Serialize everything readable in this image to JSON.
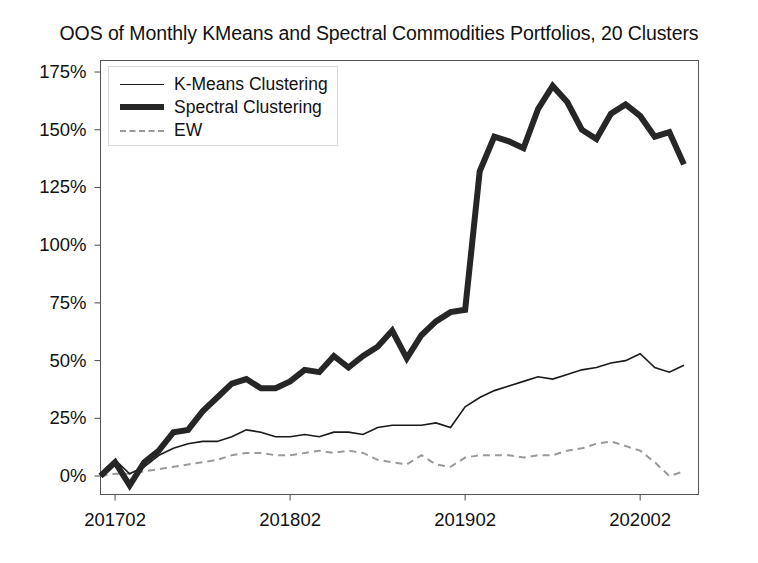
{
  "chart_data": {
    "type": "line",
    "title": "OOS of Monthly KMeans and Spectral Commodities Portfolios, 20 Clusters",
    "xlabel": "",
    "ylabel": "",
    "xlim": [
      201701,
      202006
    ],
    "ylim": [
      -8,
      180
    ],
    "grid": false,
    "legend_position": "upper left",
    "y_ticks": [
      0,
      25,
      50,
      75,
      100,
      125,
      150,
      175
    ],
    "y_tick_labels": [
      "0%",
      "25%",
      "50%",
      "75%",
      "100%",
      "125%",
      "150%",
      "175%"
    ],
    "x_ticks": [
      201702,
      201802,
      201902,
      202002
    ],
    "x_tick_labels": [
      "201702",
      "201802",
      "201902",
      "202002"
    ],
    "x": [
      201701,
      201702,
      201703,
      201704,
      201705,
      201706,
      201707,
      201708,
      201709,
      201710,
      201711,
      201712,
      201801,
      201802,
      201803,
      201804,
      201805,
      201806,
      201807,
      201808,
      201809,
      201810,
      201811,
      201812,
      201901,
      201902,
      201903,
      201904,
      201905,
      201906,
      201907,
      201908,
      201909,
      201910,
      201911,
      201912,
      202001,
      202002,
      202003,
      202004,
      202005
    ],
    "series": [
      {
        "name": "K-Means Clustering",
        "color": "#1a1a1a",
        "linestyle": "solid",
        "linewidth": 1.6,
        "values": [
          0,
          7,
          1,
          4,
          9,
          12,
          14,
          15,
          15,
          17,
          20,
          19,
          17,
          17,
          18,
          17,
          19,
          19,
          18,
          21,
          22,
          22,
          22,
          23,
          21,
          30,
          34,
          37,
          39,
          41,
          43,
          42,
          44,
          46,
          47,
          49,
          50,
          53,
          47,
          45,
          48
        ]
      },
      {
        "name": "Spectral Clustering",
        "color": "#262626",
        "linestyle": "solid",
        "linewidth": 6,
        "values": [
          0,
          6,
          -4,
          6,
          11,
          19,
          20,
          28,
          34,
          40,
          42,
          38,
          38,
          41,
          46,
          45,
          52,
          47,
          52,
          56,
          63,
          51,
          61,
          67,
          71,
          72,
          132,
          147,
          145,
          142,
          159,
          169,
          162,
          150,
          146,
          157,
          161,
          156,
          147,
          149,
          135
        ]
      },
      {
        "name": "EW",
        "color": "#9a9a9a",
        "linestyle": "dashed",
        "linewidth": 2,
        "values": [
          0,
          1,
          1,
          2,
          3,
          4,
          5,
          6,
          7,
          9,
          10,
          10,
          9,
          9,
          10,
          11,
          10,
          11,
          10,
          7,
          6,
          5,
          9,
          5,
          4,
          8,
          9,
          9,
          9,
          8,
          9,
          9,
          11,
          12,
          14,
          15,
          13,
          11,
          6,
          0,
          2
        ]
      }
    ]
  },
  "legend": {
    "items": [
      {
        "label": "K-Means Clustering",
        "style": "kmeans"
      },
      {
        "label": "Spectral Clustering",
        "style": "spectral"
      },
      {
        "label": "EW",
        "style": "ew"
      }
    ]
  },
  "colors": {
    "kmeans": "#1a1a1a",
    "spectral": "#262626",
    "ew": "#9a9a9a",
    "axis": "#4a4a4a",
    "text": "#111111"
  }
}
